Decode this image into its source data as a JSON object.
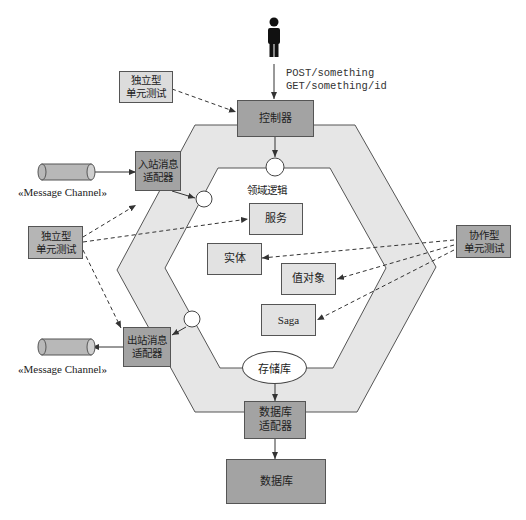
{
  "diagram": {
    "type": "hexagonal-architecture-testing",
    "colors": {
      "hexagon_band": "#e6e6e6",
      "dark_box": "#a3a3a3",
      "light_box": "#e2e2e2",
      "stroke": "#555555"
    },
    "actor": {
      "icon": "person-icon"
    },
    "request_text": {
      "line1": "POST/something",
      "line2": "GET/something/id"
    },
    "controller": {
      "label": "控制器"
    },
    "domain_logic_label": "领域逻辑",
    "domain_items": {
      "service": "服务",
      "entity": "实体",
      "value_object": "值对象",
      "saga": "Saga"
    },
    "inbound_adapter": {
      "label": "入站消息\n适配器"
    },
    "outbound_adapter": {
      "label": "出站消息\n适配器"
    },
    "repository": {
      "label": "存储库"
    },
    "db_adapter": {
      "label": "数据库\n适配器"
    },
    "database": {
      "label": "数据库"
    },
    "message_channel_in": {
      "label": "«Message Channel»"
    },
    "message_channel_out": {
      "label": "«Message Channel»"
    },
    "solitary_test_top": {
      "label": "独立型\n单元测试"
    },
    "solitary_test_left": {
      "label": "独立型\n单元测试"
    },
    "sociable_test_right": {
      "label": "协作型\n单元测试"
    }
  }
}
